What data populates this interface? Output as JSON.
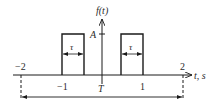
{
  "diagram": {
    "y_axis_label": "f(t)",
    "x_axis_label": "t, s",
    "amplitude_label": "A",
    "pulse_width_label": "τ",
    "period_label": "T",
    "tick_labels": [
      "−2",
      "−1",
      "1",
      "2"
    ],
    "colors": {
      "stroke": "#1a1a1a",
      "text": "#2b2b2b"
    }
  }
}
